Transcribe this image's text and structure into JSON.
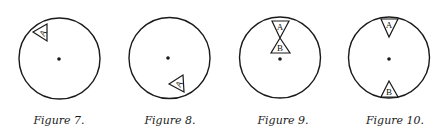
{
  "colors": {
    "stroke": "#1a1a1a",
    "background": "#ffffff"
  },
  "figures": [
    {
      "caption": "Figure 7.",
      "circle": {
        "cx": 59.5,
        "cy": 58.5,
        "r": 40.5
      },
      "center_dot": {
        "cx": 59,
        "cy": 59
      },
      "triangles": [
        {
          "label": "A",
          "label_rotated": true,
          "points": "33,32 47,24 47,41",
          "label_pos": {
            "x": 43,
            "y": 36
          }
        }
      ],
      "caption_pos": {
        "x": 59,
        "y": 124
      }
    },
    {
      "caption": "Figure 8.",
      "circle": {
        "cx": 169.5,
        "cy": 58,
        "r": 40.5
      },
      "center_dot": {
        "cx": 168,
        "cy": 58
      },
      "triangles": [
        {
          "label": "A",
          "label_rotated": true,
          "points": "169,84 183,75 184,92",
          "label_pos": {
            "x": 179,
            "y": 87
          }
        }
      ],
      "caption_pos": {
        "x": 170,
        "y": 124
      }
    },
    {
      "caption": "Figure 9.",
      "circle": {
        "cx": 280,
        "cy": 57.5,
        "r": 40.5
      },
      "center_dot": {
        "cx": 280,
        "cy": 59
      },
      "triangles": [
        {
          "label": "A",
          "label_rotated": false,
          "points": "272,21 289,21 280,38",
          "label_pos": {
            "x": 280,
            "y": 30
          }
        },
        {
          "label": "B",
          "label_rotated": false,
          "points": "280,38 271,53 290,53",
          "label_pos": {
            "x": 280,
            "y": 51
          }
        }
      ],
      "caption_pos": {
        "x": 283,
        "y": 124
      }
    },
    {
      "caption": "Figure 10.",
      "circle": {
        "cx": 389,
        "cy": 57.5,
        "r": 40.5
      },
      "center_dot": {
        "cx": 389,
        "cy": 59
      },
      "triangles": [
        {
          "label": "A",
          "label_rotated": false,
          "points": "381,19 398,19 389,37",
          "label_pos": {
            "x": 389,
            "y": 28
          }
        },
        {
          "label": "B",
          "label_rotated": false,
          "points": "389,81 381,97 398,97",
          "label_pos": {
            "x": 389,
            "y": 95
          }
        }
      ],
      "caption_pos": {
        "x": 395,
        "y": 124
      }
    }
  ]
}
